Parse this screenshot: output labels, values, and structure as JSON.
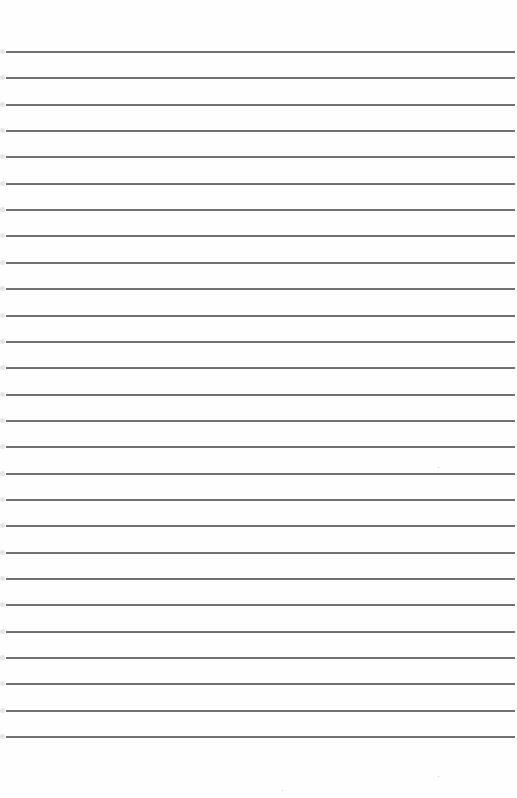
{
  "document": {
    "type": "lined-paper",
    "background_color": "#fefefe",
    "rule_color": "#6f6f6f",
    "rule_count": 27,
    "first_rule_y": 51,
    "rule_spacing_px": 26.35,
    "rule_left_x": 6,
    "rule_right_x": 515,
    "text_content": []
  }
}
